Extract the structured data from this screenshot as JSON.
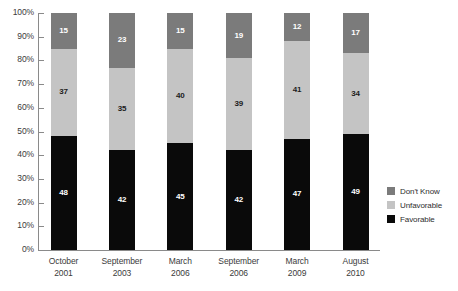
{
  "chart_data": {
    "type": "bar",
    "stacked": true,
    "title": "",
    "subtitle": "",
    "xlabel": "",
    "ylabel": "",
    "ylim": [
      0,
      100
    ],
    "ytick_labels": [
      "100%",
      "90%",
      "80%",
      "70%",
      "60%",
      "50%",
      "40%",
      "30%",
      "20%",
      "10%",
      "0%"
    ],
    "ytick_values": [
      100,
      90,
      80,
      70,
      60,
      50,
      40,
      30,
      20,
      10,
      0
    ],
    "grid": false,
    "legend_position": "right",
    "categories": [
      {
        "month": "October",
        "year": "2001"
      },
      {
        "month": "September",
        "year": "2003"
      },
      {
        "month": "March",
        "year": "2006"
      },
      {
        "month": "September",
        "year": "2006"
      },
      {
        "month": "March",
        "year": "2009"
      },
      {
        "month": "August",
        "year": "2010"
      }
    ],
    "series": [
      {
        "name": "Favorable",
        "color": "#0a0a0a",
        "values": [
          48,
          42,
          45,
          42,
          47,
          49
        ]
      },
      {
        "name": "Unfavorable",
        "color": "#c4c4c4",
        "values": [
          37,
          35,
          40,
          39,
          41,
          34
        ]
      },
      {
        "name": "Don't Know",
        "color": "#7b7b7b",
        "values": [
          15,
          23,
          15,
          19,
          12,
          17
        ]
      }
    ],
    "stack_order_bottom_to_top": [
      "Favorable",
      "Unfavorable",
      "Don't Know"
    ],
    "legend_entries": [
      {
        "label": "Don't Know",
        "color": "#7b7b7b"
      },
      {
        "label": "Unfavorable",
        "color": "#c4c4c4"
      },
      {
        "label": "Favorable",
        "color": "#0a0a0a"
      }
    ]
  }
}
